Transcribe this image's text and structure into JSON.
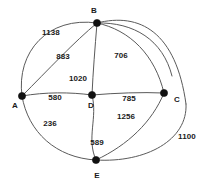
{
  "chart_data": {
    "type": "diagram",
    "diagram_kind": "weighted-undirected-graph",
    "title": "",
    "background_color": "#ffffff",
    "edge_color": "#5a5a5a",
    "node_color": "#111111",
    "label_color": "#1a1a1a",
    "nodes": [
      {
        "id": "A",
        "label": "A",
        "x": 22,
        "y": 96,
        "label_x": 15,
        "label_y": 106
      },
      {
        "id": "B",
        "label": "B",
        "x": 97,
        "y": 23,
        "label_x": 94,
        "label_y": 11
      },
      {
        "id": "C",
        "label": "C",
        "x": 164,
        "y": 93,
        "label_x": 177,
        "label_y": 100
      },
      {
        "id": "D",
        "label": "D",
        "x": 92,
        "y": 95,
        "label_x": 91,
        "label_y": 106
      },
      {
        "id": "E",
        "label": "E",
        "x": 96,
        "y": 160,
        "label_x": 97,
        "label_y": 176
      }
    ],
    "edges": [
      {
        "from": "A",
        "to": "B",
        "weight": 1138,
        "label_x": 51,
        "label_y": 33
      },
      {
        "from": "A",
        "to": "B",
        "weight": 883,
        "label_x": 63,
        "label_y": 57
      },
      {
        "from": "B",
        "to": "C",
        "weight": 706,
        "label_x": 121,
        "label_y": 56
      },
      {
        "from": "B",
        "to": "D",
        "weight": 1020,
        "label_x": 78,
        "label_y": 79
      },
      {
        "from": "A",
        "to": "D",
        "weight": 580,
        "label_x": 55,
        "label_y": 98
      },
      {
        "from": "D",
        "to": "C",
        "weight": 785,
        "label_x": 129,
        "label_y": 99
      },
      {
        "from": "A",
        "to": "E",
        "weight": 236,
        "label_x": 50,
        "label_y": 124
      },
      {
        "from": "D",
        "to": "E",
        "weight": 589,
        "label_x": 97,
        "label_y": 143
      },
      {
        "from": "E",
        "to": "C",
        "weight": 1256,
        "label_x": 126,
        "label_y": 117
      },
      {
        "from": "E",
        "to": "C",
        "weight": 1100,
        "label_x": 187,
        "label_y": 137
      }
    ],
    "edge_paths": [
      {
        "name": "edge-a-b-outer",
        "d": "M 22,96 C 16,52 48,16 97,23"
      },
      {
        "name": "edge-a-b-inner",
        "d": "M 22,96 C 48,70 74,42 97,23"
      },
      {
        "name": "edge-b-c-arc",
        "d": "M 97,23 C 130,30 155,55 164,93"
      },
      {
        "name": "edge-b-d",
        "d": "M 97,23 C 95,48 93,72 92,95"
      },
      {
        "name": "edge-a-d",
        "d": "M 22,96 C 45,92 70,92 92,95"
      },
      {
        "name": "edge-d-c",
        "d": "M 92,95 C 116,93 142,92 164,93"
      },
      {
        "name": "edge-a-e",
        "d": "M 22,96 C 28,132 56,158 96,160"
      },
      {
        "name": "edge-d-e",
        "d": "M 92,95 C 98,118 86,138 96,160"
      },
      {
        "name": "edge-e-c-inner",
        "d": "M 96,160 C 128,145 152,122 164,93"
      },
      {
        "name": "edge-e-c-outer",
        "d": "M 96,160 C 146,163 188,140 186,104"
      },
      {
        "name": "edge-b-c-outer-top",
        "d": "M 97,23 C 140,12 176,32 186,104"
      },
      {
        "name": "edge-b-outer-long",
        "d": "M 97,23 C 134,22 163,40 172,76"
      }
    ]
  }
}
